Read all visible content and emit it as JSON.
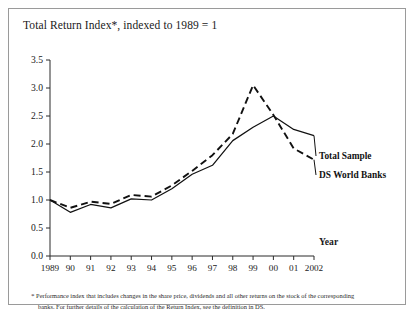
{
  "figure": {
    "title": "Total Return Index*, indexed to 1989 = 1",
    "footnote_marker": "*",
    "footnote_line1": "Performance index that includes changes in the share price, dividends and all other returns on the stock of the corresponding",
    "footnote_line2": "banks. For further details of the calculation of the Return Index, see the definition in DS."
  },
  "chart_data": {
    "type": "line",
    "title": "Total Return Index*, indexed to 1989 = 1",
    "xlabel": "Year",
    "ylabel": "",
    "ylim": [
      0.0,
      3.5
    ],
    "ytick_labels": [
      "0.0",
      "0.5",
      "1.0",
      "1.5",
      "2.0",
      "2.5",
      "3.0",
      "3.5"
    ],
    "ytick_values": [
      0.0,
      0.5,
      1.0,
      1.5,
      2.0,
      2.5,
      3.0,
      3.5
    ],
    "grid": false,
    "legend_position": "right-inline",
    "categories": [
      "1989",
      "90",
      "91",
      "92",
      "93",
      "94",
      "95",
      "96",
      "97",
      "98",
      "99",
      "00",
      "01",
      "2002"
    ],
    "x_values": [
      1989,
      1990,
      1991,
      1992,
      1993,
      1994,
      1995,
      1996,
      1997,
      1998,
      1999,
      2000,
      2001,
      2002
    ],
    "series": [
      {
        "name": "Total Sample",
        "style": "solid",
        "color": "#111111",
        "values": [
          1.0,
          0.78,
          0.92,
          0.86,
          1.02,
          1.0,
          1.2,
          1.46,
          1.62,
          2.06,
          2.3,
          2.5,
          2.26,
          2.15
        ]
      },
      {
        "name": "DS World Banks",
        "style": "dashed",
        "color": "#111111",
        "values": [
          1.0,
          0.86,
          0.97,
          0.93,
          1.09,
          1.06,
          1.26,
          1.52,
          1.8,
          2.18,
          3.05,
          2.52,
          1.92,
          1.72
        ]
      }
    ]
  },
  "legend": {
    "items": [
      {
        "label": "Total Sample",
        "style": "solid"
      },
      {
        "label": "DS World Banks",
        "style": "dashed"
      }
    ]
  },
  "axes": {
    "x_axis_name": "Year"
  }
}
